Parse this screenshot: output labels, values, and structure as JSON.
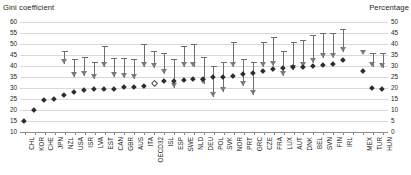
{
  "titles": {
    "left": "Gini coefficient",
    "right": "Percentage"
  },
  "chart_data": {
    "type": "scatter",
    "title": "Gini coefficient",
    "xlabel": "",
    "ylabel": "Gini coefficient",
    "y2label": "Percentage",
    "ylim": [
      10,
      60
    ],
    "y2lim": [
      0,
      50
    ],
    "grid": true,
    "legend_position": "none",
    "yticks": [
      60,
      55,
      50,
      45,
      40,
      35,
      30,
      25,
      20,
      15,
      10
    ],
    "y2ticks": [
      50,
      45,
      40,
      35,
      30,
      25,
      20,
      15,
      10,
      5,
      0
    ],
    "categories": [
      "CHL",
      "KOR",
      "CHE",
      "JPN",
      "NZL",
      "USA",
      "ISR",
      "LVA",
      "EST",
      "CAN",
      "GBR",
      "AUS",
      "ITA",
      "OECD32",
      "ISL",
      "ESP",
      "SWE",
      "NLD",
      "DEU",
      "POL",
      "SVK",
      "NOR",
      "PRT",
      "GRC",
      "CZE",
      "FRA",
      "LUX",
      "AUT",
      "DNK",
      "BEL",
      "SVN",
      "FIN",
      "IRL",
      "",
      "MEX",
      "TUR",
      "HUN"
    ],
    "series": [
      {
        "name": "Gini coefficient after taxes and transfers",
        "axis": "left",
        "marker": "diamond",
        "values": [
          15.0,
          19.8,
          24.6,
          25.0,
          26.6,
          28.0,
          29.2,
          29.4,
          29.4,
          29.6,
          30.4,
          30.6,
          31.0,
          32.4,
          33.0,
          33.4,
          33.6,
          34.0,
          34.2,
          34.8,
          35.0,
          35.6,
          36.4,
          37.0,
          37.6,
          38.6,
          39.0,
          39.4,
          39.6,
          40.2,
          40.4,
          41.0,
          42.6,
          null,
          37.6,
          30.0,
          29.4
        ]
      },
      {
        "name": "Reduction in inequality due to taxes and transfers",
        "axis": "right",
        "marker": "triangle",
        "values": [
          null,
          null,
          null,
          null,
          31.0,
          25.0,
          25.6,
          24.0,
          29.6,
          25.2,
          24.4,
          24.0,
          29.4,
          29.0,
          26.4,
          19.8,
          29.4,
          29.4,
          22.0,
          16.0,
          18.0,
          29.6,
          21.0,
          17.0,
          29.4,
          30.0,
          25.4,
          28.0,
          29.4,
          31.4,
          33.6,
          33.6,
          36.4,
          null,
          35.0,
          29.4,
          29.0
        ]
      },
      {
        "name": "Range high",
        "axis": "right",
        "marker": "cap",
        "values": [
          null,
          null,
          null,
          null,
          37.0,
          33.0,
          34.0,
          32.0,
          39.0,
          33.5,
          33.5,
          33.0,
          40.0,
          37.0,
          36.0,
          33.0,
          39.0,
          40.0,
          34.0,
          30.0,
          32.0,
          41.0,
          33.0,
          32.0,
          41.0,
          43.0,
          37.0,
          41.0,
          42.0,
          44.0,
          45.0,
          45.0,
          47.0,
          null,
          null,
          36.0,
          36.0
        ]
      }
    ]
  }
}
